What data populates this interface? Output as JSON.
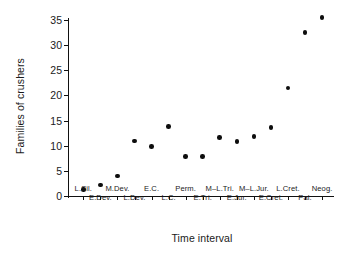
{
  "chart_data": {
    "type": "scatter",
    "title": "",
    "xlabel": "Time interval",
    "ylabel": "Families of crushers",
    "ylim": [
      0,
      36.5
    ],
    "yticks": [
      0,
      5,
      10,
      15,
      20,
      25,
      30,
      35
    ],
    "ytick_labels": [
      "0",
      "5",
      "10",
      "15",
      "20",
      "25",
      "30",
      "35"
    ],
    "grid": false,
    "legend": null,
    "marker": "filled-circle",
    "marker_color": "#0d0d0d",
    "categories": [
      "L.Sil.",
      "E.Dev.",
      "M.Dev.",
      "L.Dev.",
      "E.C.",
      "L.C.",
      "Perm.",
      "E.Tri.",
      "M–L.Tri.",
      "E.Jur.",
      "M–L.Jur.",
      "E.Cret.",
      "L.Cret.",
      "Pal.",
      "Neog."
    ],
    "values": [
      1.3,
      2.2,
      4.0,
      10.9,
      9.8,
      13.8,
      7.9,
      7.9,
      11.6,
      10.8,
      11.8,
      13.6,
      21.5,
      32.5,
      35.5
    ],
    "tick_label_rows": [
      0,
      1,
      0,
      1,
      0,
      1,
      0,
      1,
      0,
      1,
      0,
      1,
      0,
      1,
      0
    ]
  },
  "figure": {
    "background_color": "#ffffff",
    "axis_color": "#111111",
    "text_color": "#1a1a1a"
  }
}
